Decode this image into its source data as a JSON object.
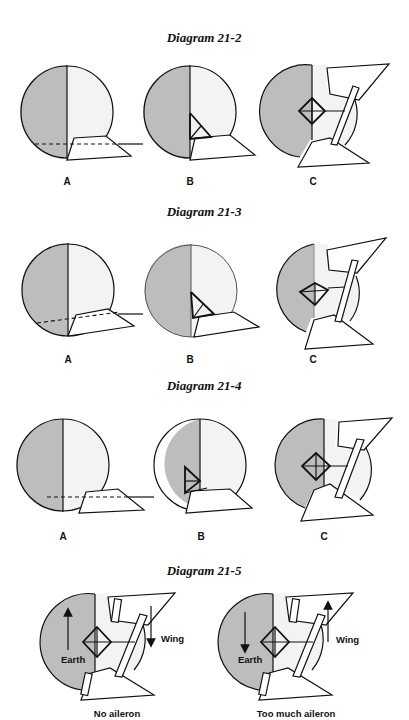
{
  "diagrams": [
    {
      "title": "Diagram 21-2",
      "panels": [
        {
          "label": "A",
          "view": "horizon-with-wing, dashed horizon line at wing level"
        },
        {
          "label": "B",
          "view": "attitude with triangle sight mark"
        },
        {
          "label": "C",
          "view": "banked view with crosshair diamond"
        }
      ]
    },
    {
      "title": "Diagram 21-3",
      "panels": [
        {
          "label": "A",
          "view": "horizon-with-wing, tilted dashed horizon"
        },
        {
          "label": "B",
          "view": "attitude with triangle sight mark"
        },
        {
          "label": "C",
          "view": "banked view with tilted crosshair diamond"
        }
      ]
    },
    {
      "title": "Diagram 21-4",
      "panels": [
        {
          "label": "A",
          "view": "horizon-with-wing, dashed horizon below center"
        },
        {
          "label": "B",
          "view": "attitude with triangle sight mark"
        },
        {
          "label": "C",
          "view": "banked view with crosshair diamond"
        }
      ]
    },
    {
      "title": "Diagram 21-5",
      "panels": [
        {
          "caption": "No aileron",
          "earth_label": "Earth",
          "wing_label": "Wing",
          "earth_arrow": "up",
          "wing_arrow": "down"
        },
        {
          "caption": "Too much aileron",
          "earth_label": "Earth",
          "wing_label": "Wing",
          "earth_arrow": "down",
          "wing_arrow": "up"
        }
      ]
    }
  ],
  "colors": {
    "earth": "#bdbdbd",
    "sky": "#f3f3f3",
    "ink": "#111111",
    "background": "#ffffff"
  }
}
